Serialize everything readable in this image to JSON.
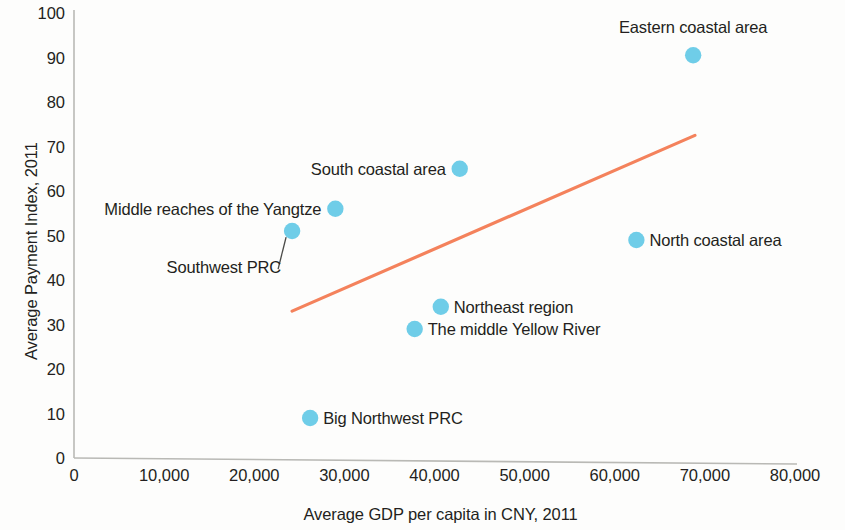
{
  "chart_data": {
    "type": "scatter",
    "title": "",
    "xlabel": "Average GDP per capita in CNY, 2011",
    "ylabel": "Average Payment Index, 2011",
    "xlim": [
      0,
      80000
    ],
    "ylim": [
      0,
      100
    ],
    "grid": false,
    "legend": "none",
    "x_ticks": [
      0,
      10000,
      20000,
      30000,
      40000,
      50000,
      60000,
      70000,
      80000
    ],
    "x_tick_labels": [
      "0",
      "10,000",
      "20,000",
      "30,000",
      "40,000",
      "50,000",
      "60,000",
      "70,000",
      "80,000"
    ],
    "y_ticks": [
      0,
      10,
      20,
      30,
      40,
      50,
      60,
      70,
      80,
      90,
      100
    ],
    "y_tick_labels": [
      "0",
      "10",
      "20",
      "30",
      "40",
      "50",
      "60",
      "70",
      "80",
      "90",
      "100"
    ],
    "marker_color": "#6FCDE8",
    "trendline": {
      "color": "#F4825C",
      "x": [
        24200,
        68900
      ],
      "y": [
        33,
        72.5
      ]
    },
    "points": [
      {
        "label": "Eastern coastal area",
        "x": 68700,
        "y": 90.5,
        "label_pos": "above"
      },
      {
        "label": "South coastal area",
        "x": 42800,
        "y": 65,
        "label_pos": "left"
      },
      {
        "label": "Middle reaches of the Yangtze",
        "x": 29000,
        "y": 56,
        "label_pos": "left"
      },
      {
        "label": "Southwest PRC",
        "x": 24200,
        "y": 51,
        "label_pos": "leader"
      },
      {
        "label": "North coastal area",
        "x": 62400,
        "y": 49,
        "label_pos": "right"
      },
      {
        "label": "Northeast region",
        "x": 40700,
        "y": 34,
        "label_pos": "right"
      },
      {
        "label": "The middle Yellow River",
        "x": 37800,
        "y": 29,
        "label_pos": "right"
      },
      {
        "label": "Big Northwest PRC",
        "x": 26200,
        "y": 9,
        "label_pos": "right"
      }
    ]
  }
}
